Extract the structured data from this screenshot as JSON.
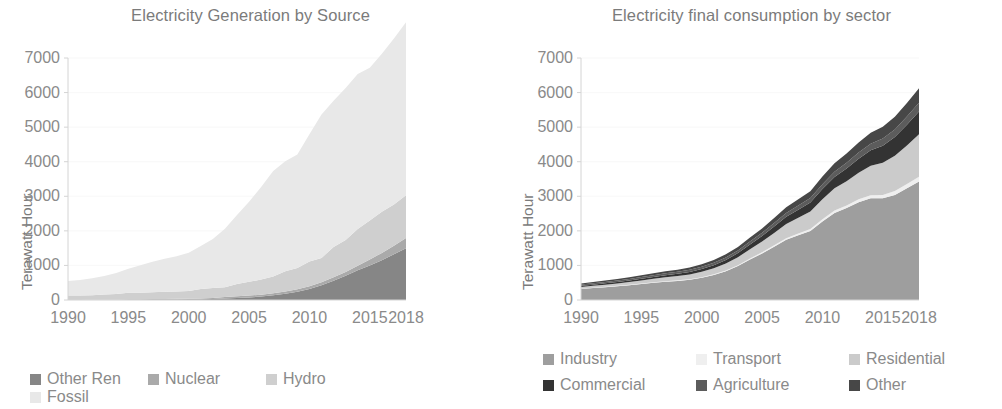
{
  "figure": {
    "background": "#ffffff",
    "axis_color": "#d4d4d4",
    "text_color": "#8a8a8a",
    "title_color": "#7b7b7b"
  },
  "left_panel": {
    "title": "Electricity Generation by Source",
    "ylabel": "Terawatt Hour",
    "yticks": [
      "7000",
      "6000",
      "5000",
      "4000",
      "3000",
      "2000",
      "1000",
      "0"
    ],
    "xticks": [
      "1990",
      "1995",
      "2000",
      "2005",
      "2010",
      "2015",
      "2018"
    ],
    "legend": [
      {
        "label": "Other Ren",
        "color": "#868686"
      },
      {
        "label": "Nuclear",
        "color": "#aaaaaa"
      },
      {
        "label": "Hydro",
        "color": "#cfcfcf"
      },
      {
        "label": "Fossil",
        "color": "#e8e8e8"
      }
    ]
  },
  "right_panel": {
    "title": "Electricity final consumption by sector",
    "ylabel": "Terawatt Hour",
    "yticks": [
      "7000",
      "6000",
      "5000",
      "4000",
      "3000",
      "2000",
      "1000",
      "0"
    ],
    "xticks": [
      "1990",
      "1995",
      "2000",
      "2005",
      "2010",
      "2015",
      "2018"
    ],
    "legend": [
      {
        "label": "Industry",
        "color": "#9e9e9e"
      },
      {
        "label": "Transport",
        "color": "#efefef"
      },
      {
        "label": "Residential",
        "color": "#cbcbcb"
      },
      {
        "label": "Commercial",
        "color": "#333333"
      },
      {
        "label": "Agriculture",
        "color": "#5c5c5c"
      },
      {
        "label": "Other",
        "color": "#474747"
      }
    ]
  },
  "chart_data": [
    {
      "type": "area",
      "stacked": true,
      "title": "Electricity Generation by Source",
      "xlabel": "",
      "ylabel": "Terawatt Hour",
      "xlim": [
        1990,
        2018
      ],
      "ylim": [
        0,
        7000
      ],
      "ytick_values": [
        0,
        1000,
        2000,
        3000,
        4000,
        5000,
        6000,
        7000
      ],
      "xtick_values": [
        1990,
        1995,
        2000,
        2005,
        2010,
        2015,
        2018
      ],
      "grid": false,
      "legend_position": "bottom",
      "x": [
        1990,
        1991,
        1992,
        1993,
        1994,
        1995,
        1996,
        1997,
        1998,
        1999,
        2000,
        2001,
        2002,
        2003,
        2004,
        2005,
        2006,
        2007,
        2008,
        2009,
        2010,
        2011,
        2012,
        2013,
        2014,
        2015,
        2016,
        2017,
        2018
      ],
      "series": [
        {
          "name": "Other Ren",
          "color": "#868686",
          "values": [
            2,
            3,
            4,
            5,
            6,
            8,
            10,
            12,
            14,
            16,
            20,
            25,
            32,
            42,
            55,
            75,
            100,
            135,
            180,
            240,
            320,
            430,
            560,
            700,
            860,
            1000,
            1150,
            1320,
            1500
          ]
        },
        {
          "name": "Nuclear",
          "color": "#aaaaaa",
          "values": [
            0,
            0,
            0,
            0,
            0,
            13,
            15,
            17,
            18,
            18,
            18,
            18,
            25,
            44,
            51,
            53,
            55,
            63,
            69,
            71,
            75,
            87,
            98,
            112,
            133,
            171,
            213,
            248,
            295
          ]
        },
        {
          "name": "Hydro",
          "color": "#cfcfcf",
          "values": [
            127,
            125,
            132,
            152,
            168,
            191,
            188,
            197,
            208,
            213,
            222,
            278,
            288,
            285,
            354,
            397,
            436,
            485,
            585,
            616,
            722,
            699,
            873,
            921,
            1064,
            1126,
            1193,
            1195,
            1232
          ]
        },
        {
          "name": "Fossil",
          "color": "#e8e8e8",
          "values": [
            420,
            450,
            490,
            540,
            610,
            690,
            790,
            880,
            950,
            1020,
            1110,
            1240,
            1420,
            1690,
            2000,
            2320,
            2680,
            3050,
            3180,
            3280,
            3680,
            4150,
            4230,
            4400,
            4480,
            4420,
            4570,
            4800,
            5010
          ]
        }
      ]
    },
    {
      "type": "area",
      "stacked": true,
      "title": "Electricity final consumption by sector",
      "xlabel": "",
      "ylabel": "Terawatt Hour",
      "xlim": [
        1990,
        2018
      ],
      "ylim": [
        0,
        7000
      ],
      "ytick_values": [
        0,
        1000,
        2000,
        3000,
        4000,
        5000,
        6000,
        7000
      ],
      "xtick_values": [
        1990,
        1995,
        2000,
        2005,
        2010,
        2015,
        2018
      ],
      "grid": false,
      "legend_position": "bottom",
      "x": [
        1990,
        1991,
        1992,
        1993,
        1994,
        1995,
        1996,
        1997,
        1998,
        1999,
        2000,
        2001,
        2002,
        2003,
        2004,
        2005,
        2006,
        2007,
        2008,
        2009,
        2010,
        2011,
        2012,
        2013,
        2014,
        2015,
        2016,
        2017,
        2018
      ],
      "series": [
        {
          "name": "Industry",
          "color": "#9e9e9e",
          "values": [
            320,
            345,
            372,
            398,
            428,
            462,
            497,
            528,
            552,
            585,
            640,
            720,
            830,
            980,
            1170,
            1345,
            1540,
            1740,
            1870,
            1995,
            2270,
            2520,
            2660,
            2830,
            2940,
            2940,
            3040,
            3230,
            3430
          ]
        },
        {
          "name": "Transport",
          "color": "#efefef",
          "values": [
            9,
            10,
            11,
            12,
            13,
            14,
            15,
            16,
            17,
            18,
            20,
            22,
            25,
            28,
            32,
            36,
            41,
            46,
            51,
            56,
            63,
            70,
            77,
            84,
            92,
            100,
            110,
            122,
            135
          ]
        },
        {
          "name": "Residential",
          "color": "#cbcbcb",
          "values": [
            48,
            54,
            61,
            69,
            78,
            88,
            100,
            112,
            124,
            138,
            155,
            175,
            200,
            230,
            268,
            310,
            360,
            415,
            460,
            510,
            580,
            640,
            700,
            770,
            850,
            930,
            1020,
            1120,
            1230
          ]
        },
        {
          "name": "Commercial",
          "color": "#333333",
          "values": [
            32,
            35,
            38,
            42,
            46,
            51,
            56,
            61,
            66,
            72,
            80,
            90,
            103,
            118,
            137,
            158,
            182,
            208,
            232,
            258,
            295,
            330,
            365,
            405,
            450,
            495,
            545,
            600,
            660
          ]
        },
        {
          "name": "Agriculture",
          "color": "#5c5c5c",
          "values": [
            36,
            38,
            40,
            42,
            45,
            48,
            51,
            54,
            57,
            60,
            64,
            68,
            73,
            79,
            86,
            94,
            102,
            111,
            120,
            130,
            142,
            153,
            165,
            178,
            191,
            205,
            220,
            236,
            253
          ]
        },
        {
          "name": "Other",
          "color": "#474747",
          "values": [
            35,
            37,
            40,
            43,
            46,
            50,
            54,
            58,
            62,
            67,
            73,
            80,
            89,
            99,
            112,
            127,
            144,
            163,
            180,
            198,
            222,
            245,
            268,
            292,
            316,
            340,
            365,
            392,
            420
          ]
        }
      ]
    }
  ]
}
